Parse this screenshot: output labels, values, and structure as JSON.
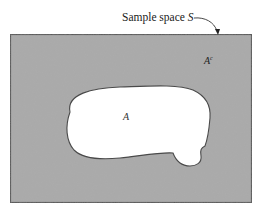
{
  "diagram": {
    "type": "venn-complement",
    "caption": {
      "text": "Sample space ",
      "symbol": "S"
    },
    "sets": [
      {
        "id": "A",
        "label": "A",
        "fill": "#ffffff"
      },
      {
        "id": "Ac",
        "label": "A",
        "superscript": "c",
        "fill": "#a9a9a9"
      }
    ],
    "colors": {
      "sample_space_fill": "#a9a9a9",
      "outline": "#555555",
      "set_fill": "#ffffff"
    }
  }
}
